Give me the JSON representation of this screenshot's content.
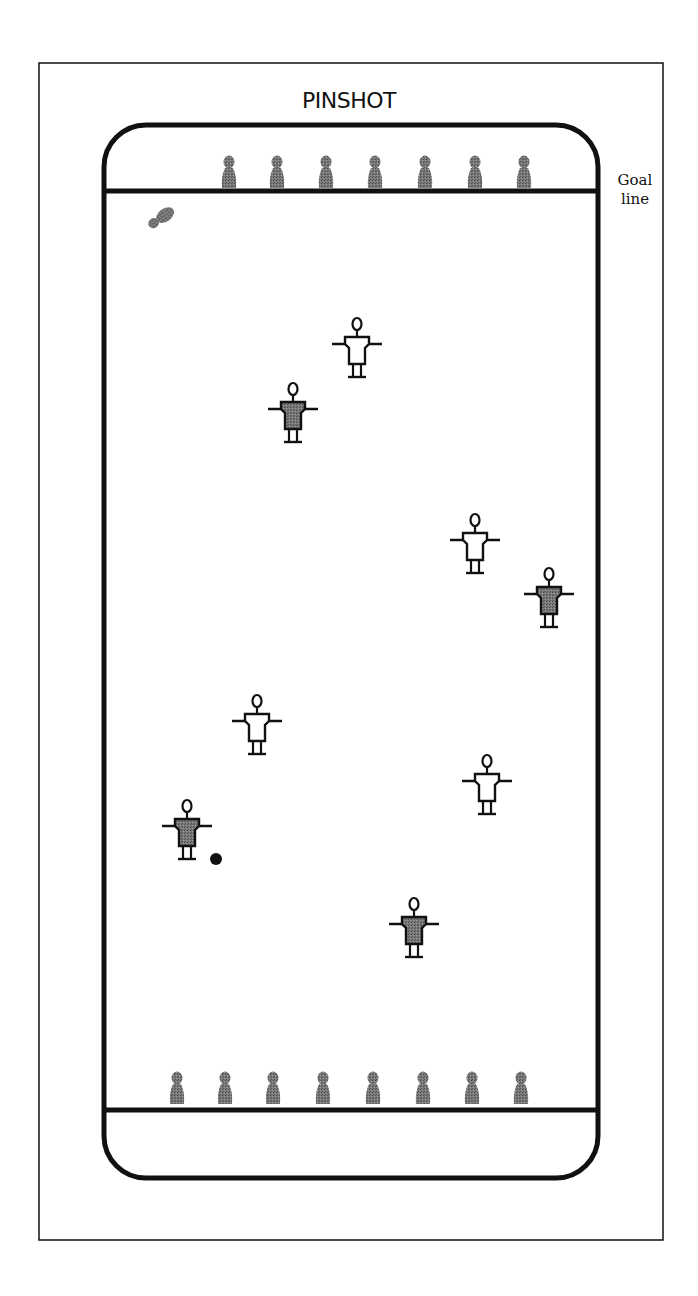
{
  "diagram": {
    "title": "PINSHOT",
    "goal_line_label_line1": "Goal",
    "goal_line_label_line2": "line",
    "colors": {
      "ink": "#111111",
      "pin": "#6e6e6e",
      "dark_team_shirt": "#6a6a6a",
      "light_team_shirt": "#ffffff",
      "ball": "#111111"
    },
    "outer_frame": {
      "x": 39,
      "y": 63,
      "w": 624,
      "h": 1177
    },
    "court": {
      "x": 104,
      "y": 125,
      "w": 494,
      "h": 1053,
      "radius": 42
    },
    "goal_lines": {
      "top_y": 191,
      "bottom_y": 1110
    },
    "top_pins_x": [
      229,
      277,
      326,
      375,
      425,
      475,
      524
    ],
    "bottom_pins_x": [
      177,
      225,
      273,
      323,
      373,
      423,
      472,
      521
    ],
    "knocked_pin": {
      "x": 161,
      "y": 218,
      "angle": -35
    },
    "players": [
      {
        "team": "light",
        "x": 357,
        "y": 324
      },
      {
        "team": "dark",
        "x": 293,
        "y": 389
      },
      {
        "team": "light",
        "x": 475,
        "y": 520
      },
      {
        "team": "dark",
        "x": 549,
        "y": 574
      },
      {
        "team": "light",
        "x": 257,
        "y": 701
      },
      {
        "team": "light",
        "x": 487,
        "y": 761
      },
      {
        "team": "dark",
        "x": 187,
        "y": 806
      },
      {
        "team": "dark",
        "x": 414,
        "y": 904
      }
    ],
    "ball": {
      "x": 216,
      "y": 859,
      "r": 6
    }
  }
}
